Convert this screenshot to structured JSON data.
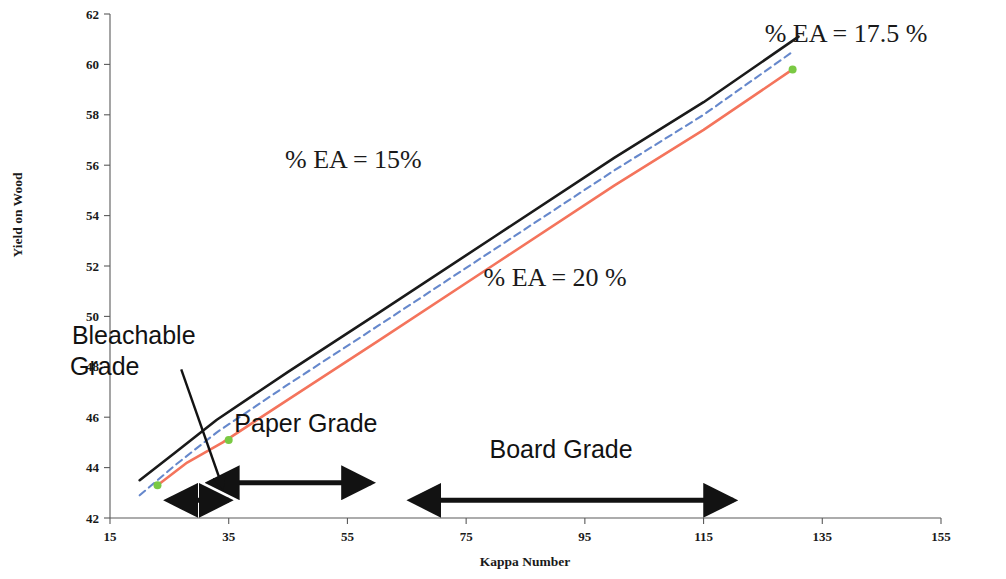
{
  "chart_data": {
    "type": "line",
    "title": "",
    "xlabel": "Kappa Number",
    "ylabel": "Yield on Wood",
    "xlim": [
      15,
      155
    ],
    "ylim": [
      42,
      62
    ],
    "xticks": [
      15,
      35,
      55,
      75,
      95,
      115,
      135,
      155
    ],
    "yticks": [
      42,
      44,
      46,
      48,
      50,
      52,
      54,
      56,
      58,
      60,
      62
    ],
    "grid": false,
    "legend": "inline-annotations",
    "series": [
      {
        "name": "% EA = 15%",
        "color": "#1a1a1a",
        "style": "solid",
        "x": [
          20,
          26,
          33,
          45,
          60,
          80,
          100,
          115,
          131
        ],
        "y": [
          43.5,
          44.6,
          45.9,
          47.8,
          50.1,
          53.2,
          56.3,
          58.5,
          61.1
        ]
      },
      {
        "name": "% EA = 17.5 %",
        "color": "#6688cc",
        "style": "dashed",
        "x": [
          20,
          26,
          33,
          45,
          60,
          80,
          100,
          115,
          130
        ],
        "y": [
          42.9,
          44.1,
          45.4,
          47.3,
          49.6,
          52.7,
          55.8,
          58.0,
          60.5
        ]
      },
      {
        "name": "% EA = 20 %",
        "color": "#f4745c",
        "style": "solid",
        "x": [
          23,
          28,
          34,
          45,
          60,
          80,
          100,
          115,
          130
        ],
        "y": [
          43.3,
          44.2,
          45.0,
          46.7,
          49.0,
          52.1,
          55.2,
          57.4,
          59.8
        ]
      }
    ],
    "markers": [
      {
        "name": "green-start-marker",
        "x": 23,
        "y": 43.3,
        "color": "#7ac943"
      },
      {
        "name": "green-mid-marker",
        "x": 35,
        "y": 45.1,
        "color": "#7ac943"
      },
      {
        "name": "green-end-marker",
        "x": 130,
        "y": 59.8,
        "color": "#7ac943"
      }
    ],
    "annotations": [
      {
        "name": "series-label-15",
        "text": "% EA = 15%",
        "x": 56,
        "y": 55.9
      },
      {
        "name": "series-label-17-5",
        "text": "% EA = 17.5 %",
        "x": 139,
        "y": 60.9
      },
      {
        "name": "series-label-20",
        "text": "% EA = 20 %",
        "x": 90,
        "y": 51.2
      },
      {
        "name": "region-label-bleachable",
        "text_line1": "Bleachable",
        "text_line2": "Grade",
        "x": 19,
        "y": 48.9
      },
      {
        "name": "region-label-paper",
        "text": "Paper Grade",
        "x": 48,
        "y": 45.4
      },
      {
        "name": "region-label-board",
        "text": "Board Grade",
        "x": 91,
        "y": 44.4
      }
    ],
    "range_arrows": [
      {
        "name": "bleachable-range-arrow",
        "x_from": 29,
        "x_to": 35,
        "y": 42.7
      },
      {
        "name": "paper-range-arrow",
        "x_from": 36,
        "x_to": 59,
        "y": 43.4
      },
      {
        "name": "board-range-arrow",
        "x_from": 70,
        "x_to": 120,
        "y": 42.7
      }
    ],
    "leader_arrows": [
      {
        "name": "bleachable-leader-arrow",
        "x_from": 27,
        "x_to": 34,
        "y_from": 47.9,
        "y_to": 43.2
      }
    ]
  }
}
